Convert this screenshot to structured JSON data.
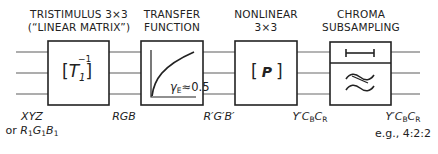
{
  "diagram": {
    "stages": [
      {
        "title_line1": "TRISTIMULUS 3×3",
        "title_line2": "(“LINEAR MATRIX”)",
        "symbol": "[T1^-1]",
        "symbol_base": "T",
        "symbol_sub": "1",
        "symbol_sup": "−1"
      },
      {
        "title_line1": "TRANSFER",
        "title_line2": "FUNCTION",
        "symbol": "gamma-curve",
        "annotation": "γ",
        "annotation_sub": "E",
        "annotation_value": "≈0.5"
      },
      {
        "title_line1": "NONLINEAR",
        "title_line2": "3×3",
        "symbol": "[P]",
        "symbol_base": "P"
      },
      {
        "title_line1": "CHROMA",
        "title_line2": "SUBSAMPLING",
        "symbol_top": "interval-bar",
        "symbol_bottom": "lowpass-filter-tilde"
      }
    ],
    "signals": [
      {
        "line1": "XYZ",
        "line2_prefix": "or ",
        "line2": "R1G1B1"
      },
      {
        "line1": "RGB"
      },
      {
        "line1": "R′G′B′"
      },
      {
        "line1": "Y′CBCR"
      },
      {
        "line1": "Y′CBCR",
        "line2": "e.g., 4:2:2"
      }
    ],
    "colors": {
      "stroke": "#222222",
      "background": "#ffffff"
    }
  }
}
